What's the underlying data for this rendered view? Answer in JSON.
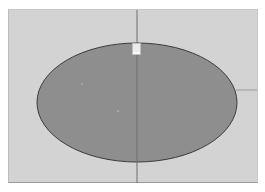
{
  "canvas": {
    "background_color": "#d3d3d3",
    "border_color": "#9a9a9a"
  },
  "shape": {
    "type": "ellipse",
    "fill_color": "#8e8e8e",
    "stroke_color": "#3a3a3a",
    "center_x": 137,
    "center_y": 102.5,
    "radius_x": 100,
    "radius_y": 59.5
  },
  "guides": {
    "vertical_line_x": 137,
    "horizontal_line_y": 90,
    "color": "#8a8a8a"
  },
  "handle": {
    "icon": "resize-handle-icon",
    "fill_color": "#f4f4f4",
    "stroke_color": "#ffffff"
  }
}
